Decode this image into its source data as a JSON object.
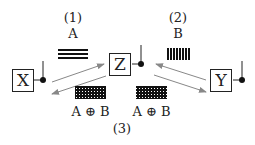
{
  "nodes": [
    {
      "id": "X",
      "label": "X"
    },
    {
      "id": "Z",
      "label": "Z"
    },
    {
      "id": "Y",
      "label": "Y"
    }
  ],
  "steps": {
    "step1": {
      "number": "(1)",
      "message": "A"
    },
    "step2": {
      "number": "(2)",
      "message": "B"
    },
    "step3": {
      "number": "(3)",
      "message_left": "A ⊕ B",
      "message_right": "A ⊕ B"
    }
  },
  "colors": {
    "line": "#222222",
    "arrow": "#888888"
  }
}
